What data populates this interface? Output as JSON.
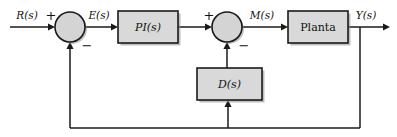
{
  "diagram": {
    "type": "control-block-diagram",
    "canvas": {
      "width": 397,
      "height": 137,
      "background": "#ffffff"
    },
    "colors": {
      "block_fill": "#d9d9d9",
      "block_stroke": "#1a1a1a",
      "sum_fill": "#d4d4d4",
      "wire": "#1a1a1a",
      "shadow": "#8a8a8a",
      "text": "#111111"
    },
    "blocks": [
      {
        "id": "pi",
        "label": "PI(s)",
        "style": "italic",
        "x": 118,
        "y": 11,
        "w": 60,
        "h": 32
      },
      {
        "id": "planta",
        "label": "Planta",
        "style": "plain",
        "x": 288,
        "y": 11,
        "w": 60,
        "h": 32
      },
      {
        "id": "d",
        "label": "D(s)",
        "style": "italic",
        "x": 197,
        "y": 68,
        "w": 65,
        "h": 32
      }
    ],
    "summing_junctions": [
      {
        "id": "sum1",
        "cx": 70,
        "cy": 27,
        "r": 15,
        "signs": [
          {
            "label": "+",
            "x": 51,
            "y": 16
          },
          {
            "label": "−",
            "x": 87,
            "y": 46
          }
        ]
      },
      {
        "id": "sum2",
        "cx": 227,
        "cy": 27,
        "r": 15,
        "signs": [
          {
            "label": "+",
            "x": 209,
            "y": 16
          },
          {
            "label": "−",
            "x": 244,
            "y": 46
          }
        ]
      }
    ],
    "signal_labels": [
      {
        "id": "r",
        "label": "R(s)",
        "x": 27,
        "y": 16
      },
      {
        "id": "e",
        "label": "E(s)",
        "x": 99,
        "y": 16
      },
      {
        "id": "m",
        "label": "M(s)",
        "x": 262,
        "y": 16
      },
      {
        "id": "y",
        "label": "Y(s)",
        "x": 366,
        "y": 16
      }
    ],
    "wires": [
      {
        "id": "input-to-sum1",
        "d": "M 10 27 L 53 27"
      },
      {
        "id": "sum1-to-pi",
        "d": "M 85 27 L 116 27"
      },
      {
        "id": "pi-to-sum2",
        "d": "M 178 27 L 210 27"
      },
      {
        "id": "sum2-to-planta",
        "d": "M 242 27 L 286 27"
      },
      {
        "id": "planta-to-output",
        "d": "M 348 27 L 388 27"
      },
      {
        "id": "output-tap-down",
        "d": "M 360 27 L 360 128"
      },
      {
        "id": "outer-feedback-bottom",
        "d": "M 360 128 L 70 128"
      },
      {
        "id": "outer-feedback-up-to-sum1",
        "d": "M 70 128 L 70 45"
      },
      {
        "id": "inner-tap-up-to-d",
        "d": "M 228 128 L 228 102"
      },
      {
        "id": "d-to-sum2",
        "d": "M 227 68 L 227 45"
      }
    ],
    "arrow_heads": [
      {
        "id": "arrow-into-sum1",
        "x": 55,
        "y": 27,
        "dir": "right"
      },
      {
        "id": "arrow-into-pi",
        "x": 118,
        "y": 27,
        "dir": "right"
      },
      {
        "id": "arrow-into-sum2",
        "x": 212,
        "y": 27,
        "dir": "right"
      },
      {
        "id": "arrow-into-planta",
        "x": 288,
        "y": 27,
        "dir": "right"
      },
      {
        "id": "arrow-output-end",
        "x": 390,
        "y": 27,
        "dir": "right"
      },
      {
        "id": "arrow-into-sum1-bottom",
        "x": 70,
        "y": 42,
        "dir": "up"
      },
      {
        "id": "arrow-into-sum2-bottom",
        "x": 227,
        "y": 42,
        "dir": "up"
      },
      {
        "id": "arrow-into-d-bottom",
        "x": 228,
        "y": 100,
        "dir": "up"
      }
    ]
  }
}
